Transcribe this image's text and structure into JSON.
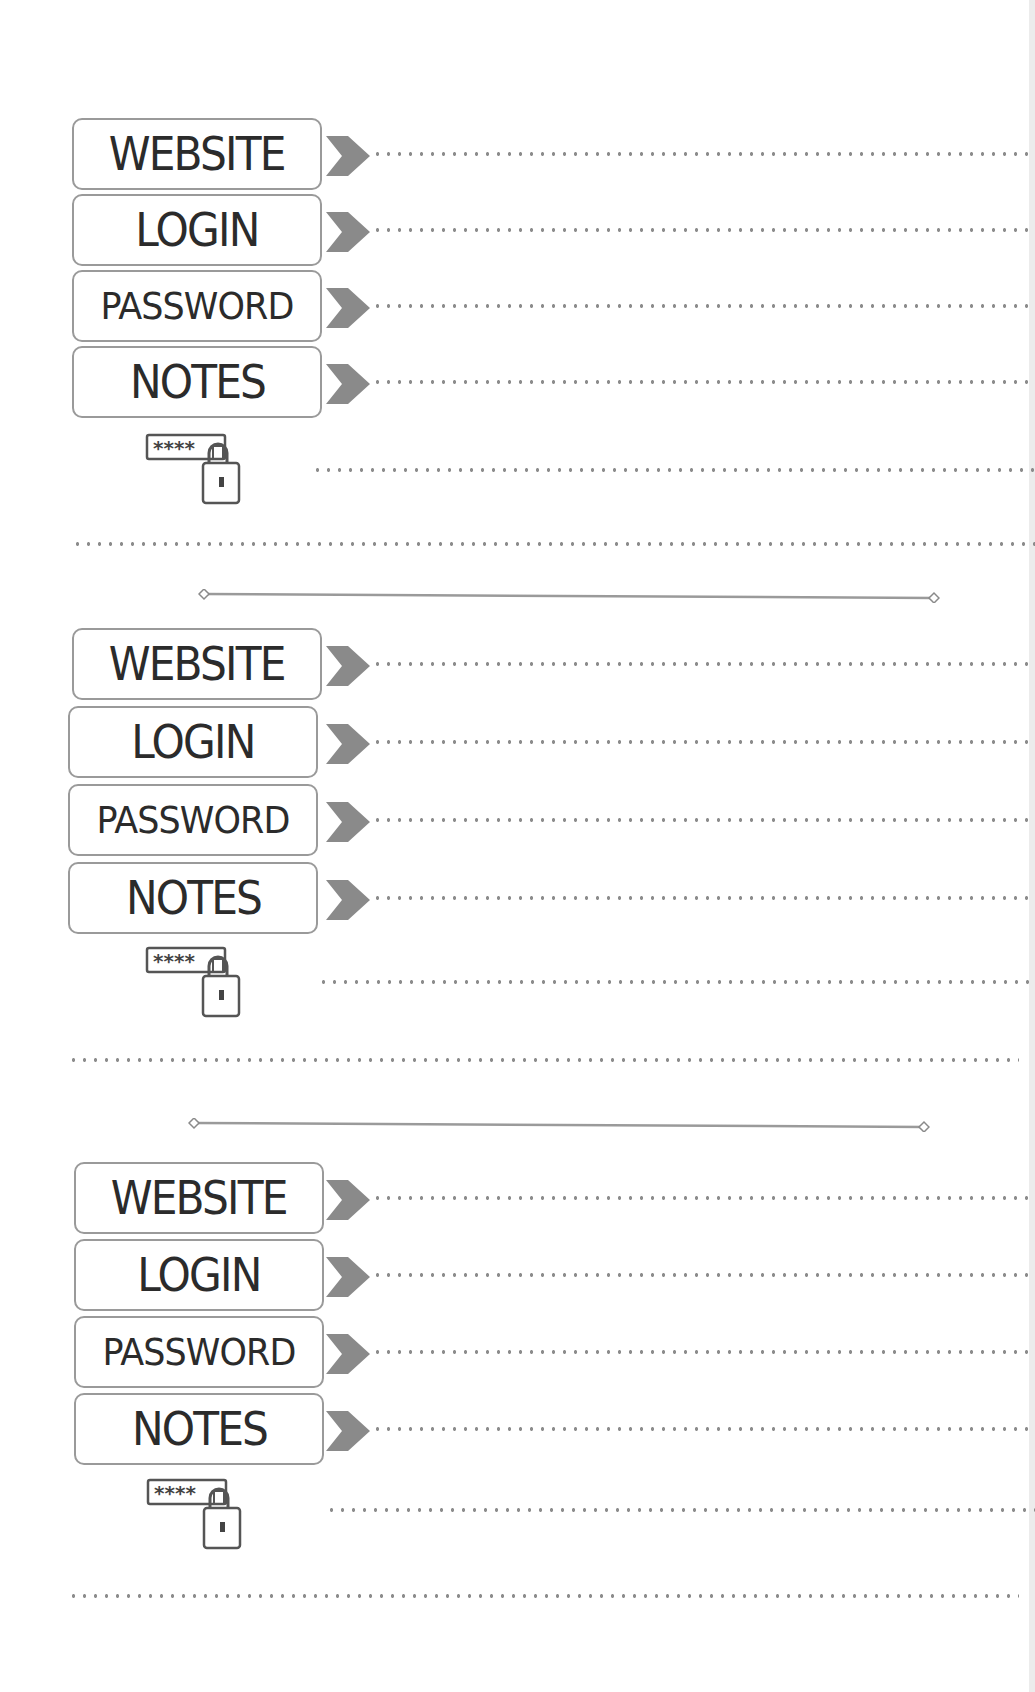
{
  "page": {
    "colors": {
      "text": "#2b2b2b",
      "box_border": "#9a9a9a",
      "chevron": "#8a8a8a",
      "dots": "#8c8c8c",
      "separator": "#9a9a9a"
    }
  },
  "entries": [
    {
      "fields": [
        {
          "label": "WEBSITE",
          "value": ""
        },
        {
          "label": "LOGIN",
          "value": ""
        },
        {
          "label": "PASSWORD",
          "value": ""
        },
        {
          "label": "NOTES",
          "value": ""
        }
      ],
      "icon": "password-lock-icon",
      "icon_text": "****"
    },
    {
      "fields": [
        {
          "label": "WEBSITE",
          "value": ""
        },
        {
          "label": "LOGIN",
          "value": ""
        },
        {
          "label": "PASSWORD",
          "value": ""
        },
        {
          "label": "NOTES",
          "value": ""
        }
      ],
      "icon": "password-lock-icon",
      "icon_text": "****"
    },
    {
      "fields": [
        {
          "label": "WEBSITE",
          "value": ""
        },
        {
          "label": "LOGIN",
          "value": ""
        },
        {
          "label": "PASSWORD",
          "value": ""
        },
        {
          "label": "NOTES",
          "value": ""
        }
      ],
      "icon": "password-lock-icon",
      "icon_text": "****"
    }
  ]
}
